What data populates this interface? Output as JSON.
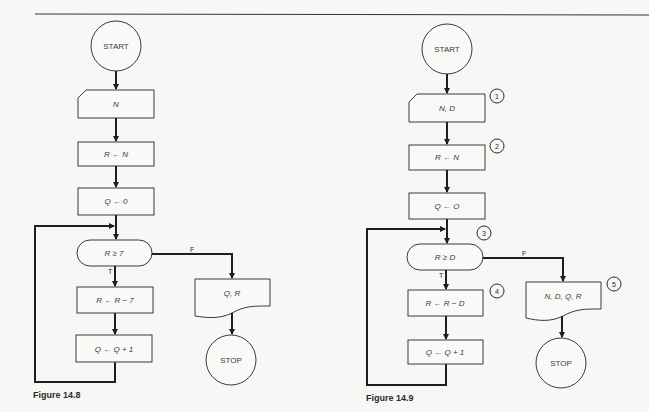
{
  "figures": [
    {
      "caption": "Figure 14.8",
      "start": "START",
      "input": "N",
      "step_assign_r": "R ← N",
      "step_assign_q": "Q ← 0",
      "decision": "R ≥ 7",
      "true_label": "T",
      "false_label": "F",
      "step_subtract": "R ← R − 7",
      "step_increment": "Q ← Q + 1",
      "output": "Q, R",
      "stop": "STOP"
    },
    {
      "caption": "Figure 14.9",
      "start": "START",
      "input": "N, D",
      "step_assign_r": "R ← N",
      "step_assign_q": "Q ← O",
      "decision": "R ≥ D",
      "true_label": "T",
      "false_label": "F",
      "step_subtract": "R ← R − D",
      "step_increment": "Q ← Q + 1",
      "output": "N, D, Q, R",
      "stop": "STOP",
      "step_numbers": [
        "1",
        "2",
        "3",
        "4",
        "5"
      ]
    }
  ]
}
